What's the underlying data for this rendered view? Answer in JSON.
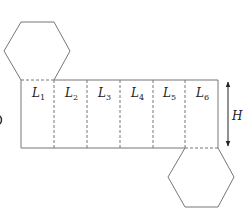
{
  "diagram": {
    "faces": [
      {
        "label": "L",
        "sub": "1"
      },
      {
        "label": "L",
        "sub": "2"
      },
      {
        "label": "L",
        "sub": "3"
      },
      {
        "label": "L",
        "sub": "4"
      },
      {
        "label": "L",
        "sub": "5"
      },
      {
        "label": "L",
        "sub": "6"
      }
    ],
    "height_label": "H",
    "stroke_color": "#777777",
    "text_color": "#222222"
  }
}
